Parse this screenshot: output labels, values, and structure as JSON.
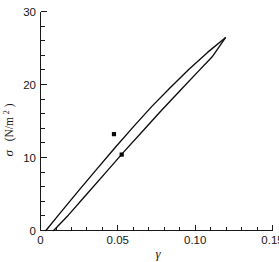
{
  "chart_data": {
    "type": "line",
    "title": "",
    "xlabel": "γ",
    "ylabel": "σ  (N/m²)",
    "ylabel_symbol": "σ",
    "ylabel_units": "(N/m",
    "ylabel_units_sup": "2",
    "ylabel_units_close": ")",
    "xlim": [
      0,
      0.15
    ],
    "ylim": [
      0,
      30
    ],
    "grid": false,
    "legend": null,
    "x_ticks_major": [
      0,
      0.05,
      0.1,
      0.15
    ],
    "x_ticklabels": [
      "0",
      "0.05",
      "0.10",
      "0.15"
    ],
    "x_tick_minor_step": 0.01,
    "y_ticks_major": [
      0,
      10,
      20,
      30
    ],
    "y_ticklabels": [
      "0",
      "10",
      "20",
      "30"
    ],
    "y_tick_minor_step": 2,
    "series": [
      {
        "name": "upper-curve",
        "style": "solid-line",
        "x": [
          0.0035,
          0.012,
          0.024,
          0.036,
          0.048,
          0.06,
          0.072,
          0.084,
          0.096,
          0.108,
          0.1195
        ],
        "y": [
          0.0,
          2.2,
          5.3,
          8.3,
          11.3,
          14.2,
          17.0,
          19.6,
          22.1,
          24.4,
          26.4
        ]
      },
      {
        "name": "lower-curve",
        "style": "solid-line",
        "x": [
          0.0085,
          0.018,
          0.03,
          0.042,
          0.054,
          0.066,
          0.078,
          0.09,
          0.102,
          0.111,
          0.1195
        ],
        "y": [
          0.0,
          2.1,
          5.0,
          7.9,
          10.8,
          13.6,
          16.4,
          19.1,
          21.8,
          23.8,
          26.4
        ]
      }
    ],
    "points": [
      {
        "name": "data-point-1",
        "x": 0.0475,
        "y": 13.2,
        "marker": "square"
      },
      {
        "name": "data-point-2",
        "x": 0.0525,
        "y": 10.4,
        "marker": "square"
      }
    ]
  }
}
